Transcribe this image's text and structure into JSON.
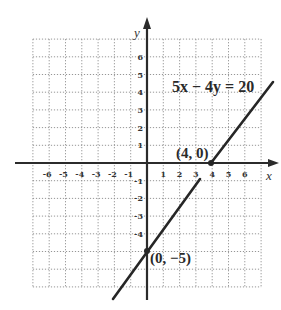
{
  "chart_data": {
    "type": "line",
    "title": "",
    "xlabel": "x",
    "ylabel": "y",
    "xlim": [
      -7,
      7
    ],
    "ylim": [
      -7,
      7
    ],
    "grid": true,
    "x_ticks": [
      -6,
      -5,
      -4,
      -3,
      -2,
      -1,
      1,
      2,
      3,
      4,
      5,
      6
    ],
    "y_ticks": [
      6,
      5,
      4,
      3,
      2,
      1,
      -1,
      -2,
      -3,
      -4
    ],
    "x_tick_labels": [
      "-6",
      "-5",
      "-4",
      "-3",
      "-2",
      "-1",
      "1",
      "2",
      "3",
      "4",
      "5",
      "6"
    ],
    "y_tick_labels": [
      "6",
      "5",
      "4",
      "3",
      "2",
      "1",
      "-1",
      "-2",
      "-3",
      "-4"
    ],
    "series": [
      {
        "name": "5x − 4y = 20",
        "equation": "y = 1.25x - 5",
        "x": [
          -2.1,
          3.3,
          4,
          7.8
        ],
        "y": [
          -7.6,
          -0.9,
          0,
          4.75
        ]
      }
    ],
    "points": [
      {
        "x": 4,
        "y": 0,
        "label": "(4, 0)"
      },
      {
        "x": 0,
        "y": -5,
        "label": "(0, −5)"
      }
    ],
    "annotations": [
      {
        "text": "5x − 4y = 20"
      },
      {
        "text": "(4, 0)"
      },
      {
        "text": "(0, −5)"
      }
    ]
  },
  "labels": {
    "x_axis": "x",
    "y_axis": "y",
    "equation": "5x − 4y = 20",
    "point_a": "(4, 0)",
    "point_b": "(0, −5)"
  },
  "colors": {
    "line": "#262626",
    "axis": "#2b2b2b",
    "grid": "#8a8a8a"
  }
}
